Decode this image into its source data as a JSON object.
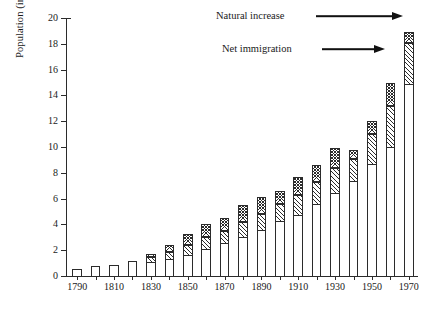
{
  "chart_data": {
    "type": "bar",
    "title": "",
    "subtitle": "",
    "xlabel": "",
    "ylabel": "Population (in millions)",
    "ylim": [
      0,
      20
    ],
    "yticks": [
      0,
      2,
      4,
      6,
      8,
      10,
      12,
      14,
      16,
      18,
      20
    ],
    "ytick_labels": [
      "0",
      "2",
      "4",
      "6",
      "8",
      "10",
      "12",
      "14",
      "16",
      "18",
      "20"
    ],
    "grid": false,
    "stacked": true,
    "legend_position": "in-plot-annotations",
    "categories": [
      "1790",
      "1800",
      "1810",
      "1820",
      "1830",
      "1840",
      "1850",
      "1860",
      "1870",
      "1880",
      "1890",
      "1900",
      "1910",
      "1920",
      "1930",
      "1940",
      "1950",
      "1960",
      "1970"
    ],
    "xtick_labels": [
      "1790",
      "1810",
      "1830",
      "1850",
      "1870",
      "1890",
      "1910",
      "1930",
      "1950",
      "1970"
    ],
    "series": [
      {
        "name": "Natural increase",
        "hatch": "diagonal",
        "values": [
          0.55,
          0.8,
          0.85,
          1.2,
          1.45,
          1.9,
          2.4,
          3.0,
          3.5,
          4.2,
          4.8,
          5.6,
          6.3,
          7.3,
          8.4,
          9.1,
          11.0,
          13.2,
          18.1
        ]
      },
      {
        "name": "Net immigration",
        "hatch": "cross",
        "values": [
          0.0,
          0.0,
          0.0,
          0.0,
          0.25,
          0.5,
          0.85,
          1.0,
          1.0,
          1.3,
          1.3,
          1.0,
          1.4,
          1.3,
          1.5,
          0.7,
          1.0,
          1.8,
          0.8
        ]
      }
    ],
    "totals": [
      0.55,
      0.8,
      0.85,
      1.2,
      1.7,
      2.4,
      3.25,
      4.0,
      4.5,
      5.5,
      6.1,
      6.6,
      7.7,
      8.6,
      9.9,
      9.8,
      12.0,
      15.0,
      18.9
    ],
    "annotations": [
      {
        "text": "Natural increase",
        "target": "1970-natural-segment"
      },
      {
        "text": "Net immigration",
        "target": "1960-immigration-segment"
      }
    ]
  },
  "colors": {
    "ink": "#2b2b2b",
    "background": "#ffffff"
  }
}
